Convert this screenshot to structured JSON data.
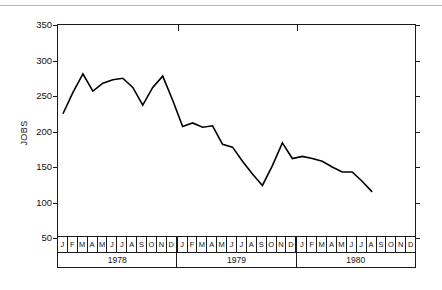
{
  "figure": {
    "axis_title": "JOBS",
    "frame_color": "#1a1a1a",
    "line_color": "#000000",
    "background": "#ffffff",
    "page_rule_color": "#b9b9b9"
  },
  "chart_data": {
    "type": "line",
    "title": "",
    "xlabel": "",
    "ylabel": "JOBS",
    "ylim": [
      50,
      350
    ],
    "yticks": [
      50,
      100,
      150,
      200,
      250,
      300,
      350
    ],
    "ytick_labels": [
      "50",
      "100",
      "150",
      "200",
      "250",
      "300",
      "350"
    ],
    "grid": false,
    "legend": false,
    "month_labels": [
      "J",
      "F",
      "M",
      "A",
      "M",
      "J",
      "J",
      "A",
      "S",
      "O",
      "N",
      "D"
    ],
    "years": [
      "1978",
      "1979",
      "1980"
    ],
    "categories": [
      "1978-J",
      "1978-F",
      "1978-M",
      "1978-A",
      "1978-M",
      "1978-J",
      "1978-J",
      "1978-A",
      "1978-S",
      "1978-O",
      "1978-N",
      "1978-D",
      "1979-J",
      "1979-F",
      "1979-M",
      "1979-A",
      "1979-M",
      "1979-J",
      "1979-J",
      "1979-A",
      "1979-S",
      "1979-O",
      "1979-N",
      "1979-D",
      "1980-J",
      "1980-F",
      "1980-M",
      "1980-A",
      "1980-M",
      "1980-J",
      "1980-J",
      "1980-A"
    ],
    "values": [
      225,
      255,
      281,
      257,
      268,
      273,
      275,
      262,
      237,
      262,
      278,
      244,
      207,
      212,
      206,
      208,
      182,
      178,
      158,
      140,
      124,
      152,
      184,
      162,
      165,
      162,
      158,
      150,
      143,
      143,
      130,
      115
    ],
    "series": [
      {
        "name": "JOBS",
        "values": [
          225,
          255,
          281,
          257,
          268,
          273,
          275,
          262,
          237,
          262,
          278,
          244,
          207,
          212,
          206,
          208,
          182,
          178,
          158,
          140,
          124,
          152,
          184,
          162,
          165,
          162,
          158,
          150,
          143,
          143,
          130,
          115
        ]
      }
    ]
  }
}
